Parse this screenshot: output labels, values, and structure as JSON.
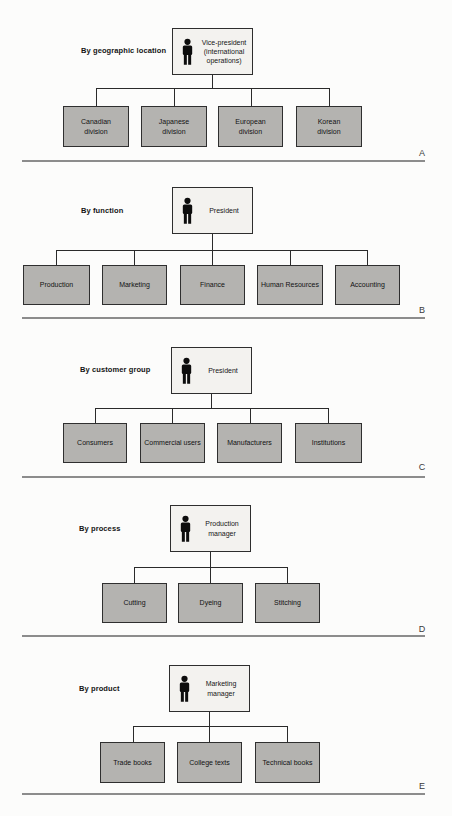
{
  "colors": {
    "parent_box_fill": "#f3f2ef",
    "child_box_fill": "#b4b3b0",
    "box_border": "#2e2e2e",
    "person_icon": "#0d0d0d",
    "divider_line": "#8c8c8c",
    "text": "#161616"
  },
  "sections": [
    {
      "letter": "A",
      "label": "By geographic location",
      "parent": {
        "icon": "person-icon",
        "title": "Vice-president\n(international\noperations)"
      },
      "children": [
        "Canadian\ndivision",
        "Japanese\ndivision",
        "European\ndivision",
        "Korean\ndivision"
      ]
    },
    {
      "letter": "B",
      "label": "By function",
      "parent": {
        "icon": "person-icon",
        "title": "President"
      },
      "children": [
        "Production",
        "Marketing",
        "Finance",
        "Human Resources",
        "Accounting"
      ]
    },
    {
      "letter": "C",
      "label": "By customer group",
      "parent": {
        "icon": "person-icon",
        "title": "President"
      },
      "children": [
        "Consumers",
        "Commercial users",
        "Manufacturers",
        "Institutions"
      ]
    },
    {
      "letter": "D",
      "label": "By process",
      "parent": {
        "icon": "person-icon",
        "title": "Production\nmanager"
      },
      "children": [
        "Cutting",
        "Dyeing",
        "Stitching"
      ]
    },
    {
      "letter": "E",
      "label": "By product",
      "parent": {
        "icon": "person-icon",
        "title": "Marketing\nmanager"
      },
      "children": [
        "Trade books",
        "College texts",
        "Technical books"
      ]
    }
  ]
}
